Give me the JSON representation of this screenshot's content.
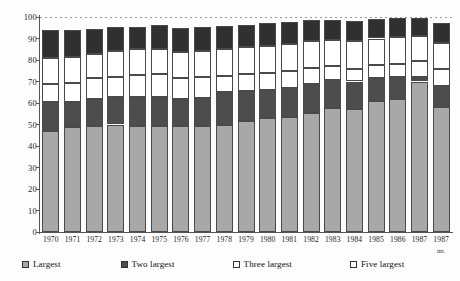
{
  "chart_data": {
    "type": "bar",
    "subtype": "stacked-bar",
    "title": "",
    "subtitle": "",
    "xlabel": "",
    "ylabel": "",
    "ylim": [
      0,
      100
    ],
    "yticks": [
      0,
      10,
      20,
      30,
      40,
      50,
      60,
      70,
      80,
      90,
      100
    ],
    "ytick_labels": [
      "0",
      "10",
      "20",
      "30",
      "40",
      "50",
      "60",
      "70",
      "80",
      "90",
      "100"
    ],
    "grid": "top-dashed-only",
    "legend_position": "bottom",
    "categories": [
      "1970",
      "1971",
      "1972",
      "1973",
      "1974",
      "1975",
      "1976",
      "1977",
      "1978",
      "1979",
      "1980",
      "1981",
      "1982",
      "1983",
      "1984",
      "1985",
      "1986",
      "1987",
      "1987"
    ],
    "category_sublabels": [
      "",
      "",
      "",
      "",
      "",
      "",
      "",
      "",
      "",
      "",
      "",
      "",
      "",
      "",
      "",
      "",
      "",
      "",
      "int."
    ],
    "cumulative": true,
    "note": "Values are cumulative concentration shares read off the axis; each series value is the stack top.",
    "series": [
      {
        "name": "Largest",
        "color": "#a8a8a8",
        "swatch": "gray",
        "cumulative_values": [
          47,
          49,
          49.5,
          50,
          49.5,
          49.5,
          49.5,
          49.5,
          50,
          51.5,
          53,
          53.5,
          55.5,
          57.5,
          57,
          61,
          62,
          70,
          58
        ],
        "segment_values": [
          47,
          49,
          49.5,
          50,
          49.5,
          49.5,
          49.5,
          49.5,
          50,
          51.5,
          53,
          53.5,
          55.5,
          57.5,
          57,
          61,
          62,
          70,
          58
        ]
      },
      {
        "name": "Two largest",
        "color": "#4d4d4d",
        "swatch": "dark",
        "cumulative_values": [
          60.5,
          60.5,
          62,
          63,
          63,
          63,
          62,
          62.5,
          65,
          65.5,
          66,
          67,
          69,
          70.5,
          70,
          71.5,
          72,
          72,
          68
        ],
        "segment_values": [
          13.5,
          11.5,
          12.5,
          13,
          13.5,
          13.5,
          12.5,
          13,
          15,
          14,
          13,
          13.5,
          13.5,
          13,
          13,
          10.5,
          10,
          2,
          10
        ]
      },
      {
        "name": "Three largest",
        "color": "#ffffff",
        "swatch": "white",
        "cumulative_values": [
          69,
          69.5,
          71.5,
          72,
          73,
          73.5,
          71.5,
          72,
          72.5,
          73.5,
          74,
          75,
          76.5,
          77,
          76,
          77.5,
          78,
          79.5,
          76
        ],
        "segment_values": [
          8.5,
          9,
          9.5,
          9,
          10,
          10.5,
          9.5,
          9.5,
          7.5,
          8,
          8,
          8,
          7.5,
          6.5,
          6,
          6,
          6,
          7.5,
          8
        ]
      },
      {
        "name": "Five largest",
        "color": "#ffffff",
        "swatch": "white",
        "cumulative_values": [
          81,
          81.5,
          83,
          84,
          85,
          85,
          83.5,
          84,
          85,
          86,
          86.5,
          87.5,
          89,
          89.5,
          89,
          90,
          90.5,
          91,
          88
        ],
        "segment_values": [
          12,
          12,
          11.5,
          12,
          12,
          11.5,
          12,
          12,
          12.5,
          12.5,
          12.5,
          12.5,
          12.5,
          12.5,
          13,
          12.5,
          12.5,
          11.5,
          12
        ]
      },
      {
        "name": "Ten largest",
        "color": "#303030",
        "swatch": "black",
        "cumulative_values": [
          94,
          94,
          94.5,
          95.5,
          95.5,
          96.5,
          95,
          95.5,
          96,
          96.5,
          97,
          97.5,
          98.5,
          98.5,
          98,
          99,
          99.5,
          99.5,
          97
        ],
        "segment_values": [
          13,
          12.5,
          11.5,
          11.5,
          10.5,
          11.5,
          11.5,
          11.5,
          11,
          10.5,
          10.5,
          10,
          9.5,
          9,
          9,
          9,
          9,
          8.5,
          9
        ]
      }
    ]
  },
  "legend": {
    "items": [
      {
        "label": "Largest",
        "swatch": "gray"
      },
      {
        "label": "Two largest",
        "swatch": "dark"
      },
      {
        "label": "Three largest",
        "swatch": "white"
      },
      {
        "label": "Five largest",
        "swatch": "white"
      },
      {
        "label": "Ten largest",
        "swatch": "black"
      }
    ]
  },
  "colors": {
    "largest": "#a8a8a8",
    "two_largest": "#4d4d4d",
    "three_largest": "#ffffff",
    "five_largest": "#ffffff",
    "ten_largest": "#303030",
    "axis": "#555555",
    "outline": "#4a4a4a",
    "background": "#fdfdfd"
  }
}
